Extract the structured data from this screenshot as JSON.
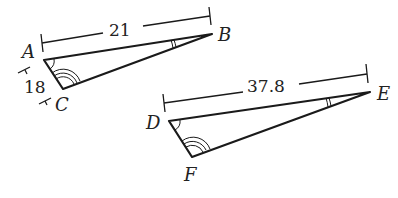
{
  "diagram": {
    "type": "similar-triangles",
    "triangle_abc": {
      "vertices": {
        "A": "A",
        "B": "B",
        "C": "C"
      },
      "sides": {
        "AB": "21",
        "AC": "18"
      },
      "angle_marks": {
        "A": "single arc",
        "B": "double arc",
        "C": "triple arc"
      }
    },
    "triangle_def": {
      "vertices": {
        "D": "D",
        "E": "E",
        "F": "F"
      },
      "sides": {
        "DE": "37.8"
      },
      "angle_marks": {
        "D": "single arc",
        "E": "double arc",
        "F": "triple arc"
      }
    }
  },
  "labels": {
    "A": "A",
    "B": "B",
    "C": "C",
    "D": "D",
    "E": "E",
    "F": "F",
    "ab_length": "21",
    "ac_length": "18",
    "de_length": "37.8"
  },
  "colors": {
    "stroke": "#1a1a1a",
    "background": "#ffffff"
  }
}
